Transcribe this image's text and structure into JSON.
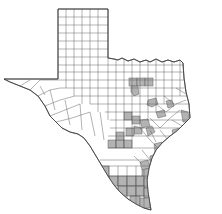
{
  "map": {
    "region": "Texas",
    "subdivision": "counties",
    "colors": {
      "background": "#ffffff",
      "county_fill": "#ffffff",
      "shaded_fill": "#b3b3b3",
      "border": "#555555"
    },
    "legend": null,
    "shaded_regions": [
      "north-central cluster (3 counties)",
      "northeast single county",
      "central Texas band",
      "Houston / upper Gulf Coast area",
      "south-central counties",
      "coastal bend counties",
      "south Texas / Rio Grande Valley counties"
    ]
  }
}
